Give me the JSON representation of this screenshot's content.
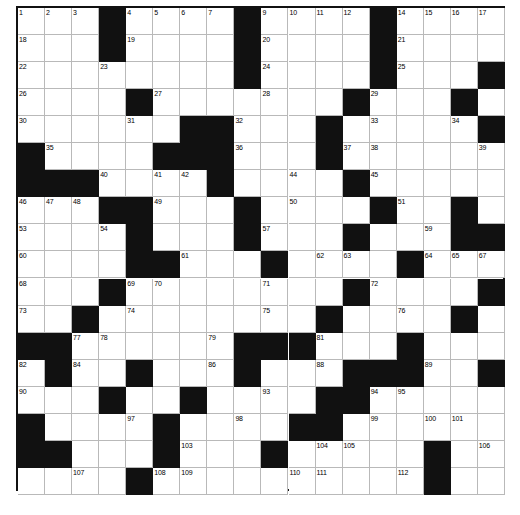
{
  "puzzle": {
    "kind": "crossword-grid",
    "rows": 18,
    "cols": 18,
    "cell_size": 27.05,
    "colors": {
      "background": "#ffffff",
      "block": "#111111",
      "grid_line": "#b9b9b9",
      "border": "#111111",
      "number": "#000000"
    },
    "blocks": [
      [
        0,
        3
      ],
      [
        0,
        8
      ],
      [
        0,
        13
      ],
      [
        1,
        3
      ],
      [
        1,
        13
      ],
      [
        2,
        8
      ],
      [
        2,
        13
      ],
      [
        2,
        17
      ],
      [
        3,
        4
      ],
      [
        3,
        12
      ],
      [
        3,
        16
      ],
      [
        4,
        6
      ],
      [
        4,
        7
      ],
      [
        4,
        11
      ],
      [
        4,
        17
      ],
      [
        5,
        0
      ],
      [
        5,
        5
      ],
      [
        5,
        6
      ],
      [
        5,
        7
      ],
      [
        5,
        11
      ],
      [
        6,
        0
      ],
      [
        6,
        1
      ],
      [
        6,
        2
      ],
      [
        6,
        7
      ],
      [
        6,
        12
      ],
      [
        7,
        3
      ],
      [
        7,
        4
      ],
      [
        7,
        8
      ],
      [
        7,
        13
      ],
      [
        7,
        16
      ],
      [
        8,
        4
      ],
      [
        8,
        8
      ],
      [
        8,
        12
      ],
      [
        8,
        16
      ],
      [
        8,
        17
      ],
      [
        9,
        4
      ],
      [
        9,
        5
      ],
      [
        9,
        9
      ],
      [
        9,
        14
      ],
      [
        10,
        3
      ],
      [
        10,
        12
      ],
      [
        10,
        17
      ],
      [
        11,
        2
      ],
      [
        11,
        11
      ],
      [
        11,
        16
      ],
      [
        12,
        0
      ],
      [
        12,
        1
      ],
      [
        12,
        8
      ],
      [
        12,
        9
      ],
      [
        12,
        14
      ],
      [
        13,
        1
      ],
      [
        13,
        4
      ],
      [
        13,
        8
      ],
      [
        13,
        12
      ],
      [
        13,
        13
      ],
      [
        13,
        17
      ],
      [
        14,
        3
      ],
      [
        14,
        6
      ],
      [
        14,
        11
      ],
      [
        14,
        12
      ],
      [
        15,
        0
      ],
      [
        15,
        5
      ],
      [
        15,
        10
      ],
      [
        15,
        11
      ],
      [
        16,
        0
      ],
      [
        16,
        1
      ],
      [
        16,
        5
      ],
      [
        16,
        9
      ],
      [
        16,
        15
      ],
      [
        17,
        4
      ],
      [
        17,
        15
      ]
    ],
    "numbers": [
      {
        "r": 0,
        "c": 0,
        "n": "1"
      },
      {
        "r": 0,
        "c": 1,
        "n": "2"
      },
      {
        "r": 0,
        "c": 2,
        "n": "3"
      },
      {
        "r": 0,
        "c": 4,
        "n": "4"
      },
      {
        "r": 0,
        "c": 5,
        "n": "5"
      },
      {
        "r": 0,
        "c": 6,
        "n": "6"
      },
      {
        "r": 0,
        "c": 7,
        "n": "7"
      },
      {
        "r": 0,
        "c": 8,
        "n": "8"
      },
      {
        "r": 0,
        "c": 9,
        "n": "9"
      },
      {
        "r": 0,
        "c": 10,
        "n": "10"
      },
      {
        "r": 0,
        "c": 11,
        "n": "11"
      },
      {
        "r": 0,
        "c": 12,
        "n": "12"
      },
      {
        "r": 0,
        "c": 13,
        "n": "13"
      },
      {
        "r": 0,
        "c": 14,
        "n": "14"
      },
      {
        "r": 0,
        "c": 15,
        "n": "15"
      },
      {
        "r": 0,
        "c": 16,
        "n": "16"
      },
      {
        "r": 0,
        "c": 17,
        "n": "17"
      },
      {
        "r": 1,
        "c": 0,
        "n": "18"
      },
      {
        "r": 1,
        "c": 4,
        "n": "19"
      },
      {
        "r": 1,
        "c": 9,
        "n": "20"
      },
      {
        "r": 1,
        "c": 14,
        "n": "21"
      },
      {
        "r": 2,
        "c": 0,
        "n": "22"
      },
      {
        "r": 2,
        "c": 3,
        "n": "23"
      },
      {
        "r": 2,
        "c": 9,
        "n": "24"
      },
      {
        "r": 2,
        "c": 14,
        "n": "25"
      },
      {
        "r": 3,
        "c": 0,
        "n": "26"
      },
      {
        "r": 3,
        "c": 5,
        "n": "27"
      },
      {
        "r": 3,
        "c": 9,
        "n": "28"
      },
      {
        "r": 3,
        "c": 13,
        "n": "29"
      },
      {
        "r": 4,
        "c": 0,
        "n": "30"
      },
      {
        "r": 4,
        "c": 4,
        "n": "31"
      },
      {
        "r": 4,
        "c": 8,
        "n": "32"
      },
      {
        "r": 4,
        "c": 13,
        "n": "33"
      },
      {
        "r": 4,
        "c": 16,
        "n": "34"
      },
      {
        "r": 5,
        "c": 1,
        "n": "35"
      },
      {
        "r": 5,
        "c": 8,
        "n": "36"
      },
      {
        "r": 5,
        "c": 12,
        "n": "37"
      },
      {
        "r": 5,
        "c": 13,
        "n": "38"
      },
      {
        "r": 5,
        "c": 17,
        "n": "39"
      },
      {
        "r": 6,
        "c": 3,
        "n": "40"
      },
      {
        "r": 6,
        "c": 5,
        "n": "41"
      },
      {
        "r": 6,
        "c": 6,
        "n": "42"
      },
      {
        "r": 6,
        "c": 7,
        "n": "43"
      },
      {
        "r": 6,
        "c": 10,
        "n": "44"
      },
      {
        "r": 6,
        "c": 13,
        "n": "45"
      },
      {
        "r": 7,
        "c": 0,
        "n": "46"
      },
      {
        "r": 7,
        "c": 1,
        "n": "47"
      },
      {
        "r": 7,
        "c": 2,
        "n": "48"
      },
      {
        "r": 7,
        "c": 5,
        "n": "49"
      },
      {
        "r": 7,
        "c": 10,
        "n": "50"
      },
      {
        "r": 7,
        "c": 14,
        "n": "51"
      },
      {
        "r": 7,
        "c": 16,
        "n": "52"
      },
      {
        "r": 8,
        "c": 0,
        "n": "53"
      },
      {
        "r": 8,
        "c": 3,
        "n": "54"
      },
      {
        "r": 8,
        "c": 4,
        "n": "55"
      },
      {
        "r": 8,
        "c": 8,
        "n": "56"
      },
      {
        "r": 8,
        "c": 9,
        "n": "57"
      },
      {
        "r": 8,
        "c": 12,
        "n": "58"
      },
      {
        "r": 8,
        "c": 15,
        "n": "59"
      },
      {
        "r": 9,
        "c": 0,
        "n": "60"
      },
      {
        "r": 9,
        "c": 6,
        "n": "61"
      },
      {
        "r": 9,
        "c": 11,
        "n": "62"
      },
      {
        "r": 9,
        "c": 12,
        "n": "63"
      },
      {
        "r": 9,
        "c": 15,
        "n": "64"
      },
      {
        "r": 9,
        "c": 16,
        "n": "65"
      },
      {
        "r": 9,
        "c": 17,
        "n": "66"
      },
      {
        "r": 10,
        "c": 0,
        "n": "68"
      },
      {
        "r": 10,
        "c": 4,
        "n": "69"
      },
      {
        "r": 10,
        "c": 5,
        "n": "70"
      },
      {
        "r": 10,
        "c": 9,
        "n": "71"
      },
      {
        "r": 10,
        "c": 13,
        "n": "72"
      },
      {
        "r": 11,
        "c": 0,
        "n": "73"
      },
      {
        "r": 11,
        "c": 4,
        "n": "74"
      },
      {
        "r": 11,
        "c": 9,
        "n": "75"
      },
      {
        "r": 11,
        "c": 14,
        "n": "76"
      },
      {
        "r": 12,
        "c": 2,
        "n": "77"
      },
      {
        "r": 12,
        "c": 3,
        "n": "78"
      },
      {
        "r": 12,
        "c": 7,
        "n": "79"
      },
      {
        "r": 12,
        "c": 10,
        "n": "80"
      },
      {
        "r": 12,
        "c": 11,
        "n": "81"
      },
      {
        "r": 13,
        "c": 0,
        "n": "82"
      },
      {
        "r": 13,
        "c": 1,
        "n": "83"
      },
      {
        "r": 13,
        "c": 2,
        "n": "84"
      },
      {
        "r": 13,
        "c": 4,
        "n": "85"
      },
      {
        "r": 13,
        "c": 7,
        "n": "86"
      },
      {
        "r": 13,
        "c": 8,
        "n": "87"
      },
      {
        "r": 13,
        "c": 11,
        "n": "88"
      },
      {
        "r": 13,
        "c": 15,
        "n": "89"
      },
      {
        "r": 14,
        "c": 0,
        "n": "90"
      },
      {
        "r": 14,
        "c": 3,
        "n": "91"
      },
      {
        "r": 14,
        "c": 6,
        "n": "92"
      },
      {
        "r": 14,
        "c": 9,
        "n": "93"
      },
      {
        "r": 14,
        "c": 13,
        "n": "94"
      },
      {
        "r": 14,
        "c": 14,
        "n": "95"
      },
      {
        "r": 15,
        "c": 0,
        "n": "96"
      },
      {
        "r": 15,
        "c": 4,
        "n": "97"
      },
      {
        "r": 15,
        "c": 8,
        "n": "98"
      },
      {
        "r": 15,
        "c": 13,
        "n": "99"
      },
      {
        "r": 15,
        "c": 15,
        "n": "100"
      },
      {
        "r": 15,
        "c": 16,
        "n": "101"
      },
      {
        "r": 16,
        "c": 1,
        "n": "102"
      },
      {
        "r": 16,
        "c": 6,
        "n": "103"
      },
      {
        "r": 16,
        "c": 11,
        "n": "104"
      },
      {
        "r": 16,
        "c": 12,
        "n": "105"
      },
      {
        "r": 16,
        "c": 17,
        "n": "106"
      },
      {
        "r": 17,
        "c": 2,
        "n": "107"
      },
      {
        "r": 17,
        "c": 5,
        "n": "108"
      },
      {
        "r": 17,
        "c": 6,
        "n": "109"
      },
      {
        "r": 17,
        "c": 10,
        "n": "110"
      },
      {
        "r": 17,
        "c": 11,
        "n": "111"
      },
      {
        "r": 17,
        "c": 14,
        "n": "112"
      }
    ]
  },
  "extra_numbers": [
    {
      "r": 9,
      "c": 17,
      "n": "67"
    },
    {
      "r": 18,
      "c": 0,
      "n": "113"
    }
  ]
}
